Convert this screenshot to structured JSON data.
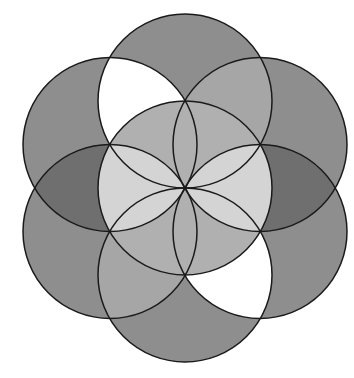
{
  "figure": {
    "center": [
      185,
      188
    ],
    "radius": 87,
    "colors": {
      "outer": "#8c8c8c",
      "outer_dark": "#6e6e6e",
      "center": "#b4b4b4",
      "petal": "#d2d2d2",
      "white": "#ffffff",
      "stroke": "#1a1a1a"
    }
  }
}
